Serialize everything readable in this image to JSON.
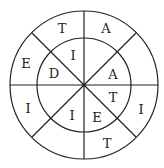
{
  "diagram": {
    "type": "letter-wheel",
    "outer_ring": [
      {
        "label": "T",
        "x": 62,
        "y": 28
      },
      {
        "label": "A",
        "x": 106,
        "y": 28
      },
      {
        "label": "E",
        "x": 26,
        "y": 63
      },
      {
        "label": "I",
        "x": 28,
        "y": 108
      },
      {
        "label": "I",
        "x": 141,
        "y": 109
      },
      {
        "label": "T",
        "x": 107,
        "y": 143
      }
    ],
    "inner_ring": [
      {
        "label": "I",
        "x": 73,
        "y": 55
      },
      {
        "label": "D",
        "x": 54,
        "y": 73
      },
      {
        "label": "A",
        "x": 113,
        "y": 74
      },
      {
        "label": "T",
        "x": 113,
        "y": 97
      },
      {
        "label": "I",
        "x": 72,
        "y": 115
      },
      {
        "label": "E",
        "x": 97,
        "y": 117
      }
    ]
  }
}
